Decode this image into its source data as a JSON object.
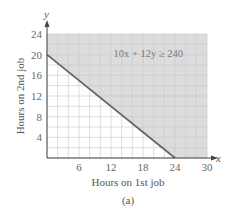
{
  "chart_data": {
    "type": "area",
    "title": "",
    "caption": "(a)",
    "xlabel": "Hours on 1st job",
    "ylabel": "Hours on 2nd job",
    "x_axis_var": "x",
    "y_axis_var": "y",
    "xlim": [
      0,
      30
    ],
    "ylim": [
      0,
      24
    ],
    "x_ticks": [
      6,
      12,
      18,
      24,
      30
    ],
    "y_ticks": [
      4,
      8,
      12,
      16,
      20,
      24
    ],
    "grid": true,
    "grid_minor_step": 2,
    "boundary_line": {
      "equation": "10x + 12y = 240",
      "points": [
        [
          0,
          20
        ],
        [
          24,
          0
        ]
      ]
    },
    "shaded_region": {
      "inequality": "10x + 12y ≥ 240",
      "description": "region above line, shaded"
    },
    "annotation": {
      "text": "10x + 12y ≥ 240",
      "x": 19,
      "y": 19.5
    },
    "colors": {
      "shade": "#dcdcdc",
      "line": "#666666",
      "grid": "#c8c8c8",
      "axis": "#444444"
    }
  }
}
